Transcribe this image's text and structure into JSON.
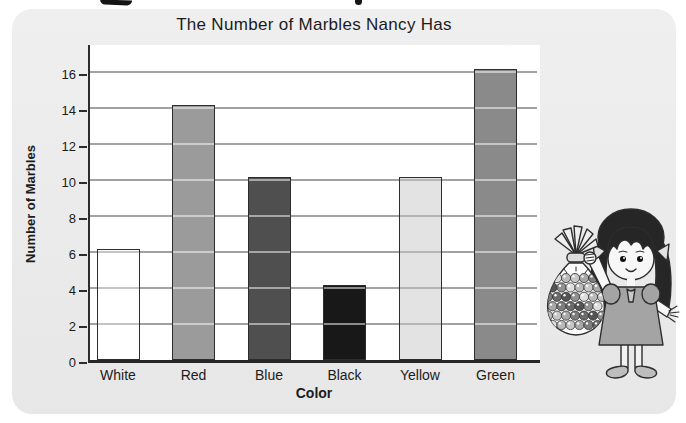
{
  "chart_data": {
    "type": "bar",
    "title": "The Number of Marbles Nancy Has",
    "xlabel": "Color",
    "ylabel": "Number of Marbles",
    "categories": [
      "White",
      "Red",
      "Blue",
      "Black",
      "Yellow",
      "Green"
    ],
    "values": [
      6,
      14,
      10,
      4,
      10,
      16
    ],
    "bar_colors": [
      "#ffffff",
      "#9b9b9b",
      "#4f4f4f",
      "#181818",
      "#e3e3e3",
      "#8a8a8a"
    ],
    "yticks": [
      0,
      2,
      4,
      6,
      8,
      10,
      12,
      14,
      16
    ],
    "ylim": [
      0,
      17.5
    ],
    "grid": "horizontal-only",
    "legend_position": "none"
  },
  "illustration": {
    "name": "girl-holding-bag-of-marbles"
  },
  "colors": {
    "card_background": "#eaeaea",
    "plot_background": "#ffffff",
    "axis": "#2d2d2d",
    "gridline": "#a2a2a2",
    "text": "#1c1c1c"
  }
}
